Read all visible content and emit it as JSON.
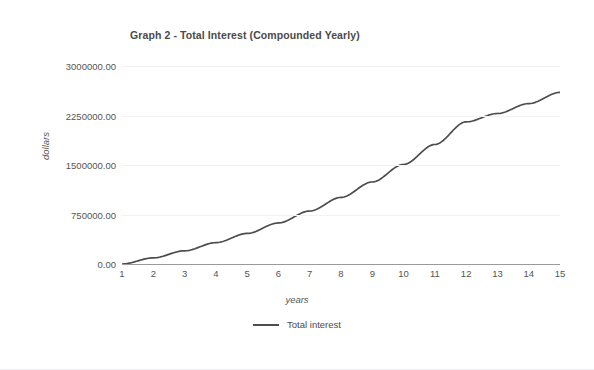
{
  "chart_data": {
    "type": "line",
    "title": "Graph 2 - Total Interest (Compounded Yearly)",
    "xlabel": "years",
    "ylabel": "dollars",
    "grid": true,
    "legend_position": "bottom-center",
    "line_color": "#4d4d4d",
    "grid_color": "#f2f2f5",
    "axis_color": "#9a9a9a",
    "x": [
      1,
      2,
      3,
      4,
      5,
      6,
      7,
      8,
      9,
      10,
      11,
      12,
      13,
      14,
      15
    ],
    "xtick_labels": [
      "1",
      "2",
      "3",
      "4",
      "5",
      "6",
      "7",
      "8",
      "9",
      "10",
      "11",
      "12",
      "13",
      "14",
      "15"
    ],
    "xlim": [
      1,
      15
    ],
    "ylim": [
      0,
      3000000
    ],
    "ytick_labels": [
      "3000000.00",
      "2250000.00",
      "1500000.00",
      "750000.00",
      "0.00"
    ],
    "ytick_values": [
      3000000,
      2250000,
      1500000,
      750000,
      0
    ],
    "series": [
      {
        "name": "Total interest",
        "values": [
          0,
          93000,
          200000,
          323000,
          463000,
          622000,
          803000,
          1009000,
          1243000,
          1509000,
          1811000,
          2154000,
          2280000,
          2430000,
          2600000
        ]
      }
    ]
  },
  "legend": {
    "entries": [
      {
        "label": "Total interest",
        "swatch": "line-swatch",
        "color": "#4d4d4d"
      }
    ]
  }
}
